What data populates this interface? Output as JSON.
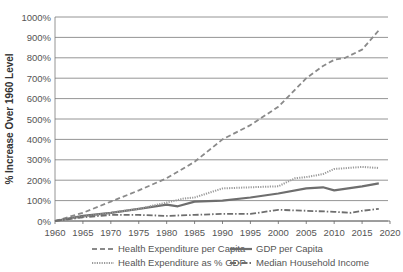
{
  "chart_data": {
    "type": "line",
    "title": "",
    "xlabel": "",
    "ylabel": "% Increase Over 1960 Level",
    "xlim": [
      1960,
      2020
    ],
    "ylim": [
      0,
      1000
    ],
    "x_ticks": [
      1960,
      1965,
      1970,
      1975,
      1980,
      1985,
      1990,
      1995,
      2000,
      2005,
      2010,
      2015,
      2020
    ],
    "y_ticks": [
      0,
      100,
      200,
      300,
      400,
      500,
      600,
      700,
      800,
      900,
      1000
    ],
    "y_tick_labels": [
      "0%",
      "100%",
      "200%",
      "300%",
      "400%",
      "500%",
      "600%",
      "700%",
      "800%",
      "900%",
      "1000%"
    ],
    "grid": "horizontal",
    "legend_position": "bottom",
    "series": [
      {
        "name": "Health Expenditure per Capita",
        "style": "dashed",
        "color": "#8a8a8a",
        "x": [
          1960,
          1965,
          1970,
          1975,
          1980,
          1985,
          1990,
          1995,
          2000,
          2005,
          2008,
          2010,
          2012,
          2015,
          2018
        ],
        "values": [
          0,
          40,
          95,
          150,
          210,
          290,
          400,
          470,
          560,
          700,
          760,
          790,
          800,
          840,
          935
        ]
      },
      {
        "name": "GDP per Capita",
        "style": "solid",
        "color": "#6e6e6e",
        "x": [
          1960,
          1965,
          1970,
          1975,
          1980,
          1982,
          1985,
          1990,
          1995,
          2000,
          2005,
          2008,
          2010,
          2015,
          2018
        ],
        "values": [
          0,
          25,
          40,
          60,
          80,
          72,
          95,
          100,
          115,
          135,
          160,
          165,
          150,
          170,
          185
        ]
      },
      {
        "name": "Health Expenditure as % GDP",
        "style": "dotted",
        "color": "#9a9a9a",
        "x": [
          1960,
          1965,
          1970,
          1975,
          1980,
          1983,
          1985,
          1990,
          1995,
          2000,
          2003,
          2005,
          2008,
          2010,
          2015,
          2018
        ],
        "values": [
          0,
          20,
          40,
          60,
          90,
          110,
          115,
          160,
          165,
          170,
          210,
          215,
          230,
          255,
          265,
          260
        ]
      },
      {
        "name": "Median Household Income",
        "style": "dash-dot",
        "color": "#6e6e6e",
        "x": [
          1960,
          1965,
          1970,
          1975,
          1980,
          1985,
          1990,
          1995,
          2000,
          2005,
          2010,
          2013,
          2015,
          2018
        ],
        "values": [
          0,
          18,
          30,
          30,
          25,
          30,
          35,
          35,
          55,
          50,
          45,
          40,
          50,
          60
        ]
      }
    ]
  },
  "legend": {
    "items": [
      {
        "label": "Health Expenditure per Capita",
        "style": "dashed"
      },
      {
        "label": "GDP per Capita",
        "style": "solid"
      },
      {
        "label": "Health Expenditure as % GDP",
        "style": "dotted"
      },
      {
        "label": "Median Household Income",
        "style": "dash-dot"
      }
    ]
  }
}
